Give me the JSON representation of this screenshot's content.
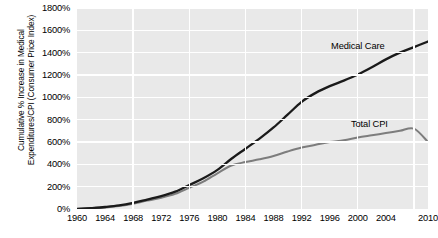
{
  "chart_data": {
    "type": "line",
    "title": "",
    "xlabel": "",
    "ylabel": "Cumulative % Increase in Medical Expenditures/CPI (Consumer Price Index)",
    "ylabel_lines": [
      "Cumulative % Increase in Medical",
      "Expenditures/CPI (Consumer Price Index)"
    ],
    "xlim": [
      1960,
      2010
    ],
    "ylim": [
      0,
      1800
    ],
    "grid": true,
    "legend_position": "inline-labels",
    "y_ticks": [
      0,
      200,
      400,
      600,
      800,
      1000,
      1200,
      1400,
      1600,
      1800
    ],
    "y_tick_labels": [
      "0%",
      "200%",
      "400%",
      "600%",
      "800%",
      "1000%",
      "1200%",
      "1400%",
      "1600%",
      "1800%"
    ],
    "x_ticks": [
      1960,
      1964,
      1968,
      1972,
      1976,
      1980,
      1984,
      1988,
      1992,
      1996,
      2000,
      2004,
      2010
    ],
    "x_tick_labels": [
      "1960",
      "1964",
      "1968",
      "1972",
      "1976",
      "1980",
      "1984",
      "1988",
      "1992",
      "1996",
      "2000",
      "2004",
      "2010"
    ],
    "x_gridlines": [
      1968,
      1976,
      1984,
      1992,
      2000,
      2008
    ],
    "series": [
      {
        "name": "Medical Care",
        "color": "#1a1a1a",
        "label_text": "Medical Care",
        "x": [
          1960,
          1962,
          1964,
          1966,
          1968,
          1970,
          1972,
          1974,
          1976,
          1978,
          1980,
          1982,
          1984,
          1986,
          1988,
          1990,
          1992,
          1994,
          1996,
          1998,
          2000,
          2002,
          2004,
          2006,
          2008,
          2010
        ],
        "values": [
          0,
          8,
          18,
          32,
          55,
          85,
          115,
          155,
          215,
          275,
          350,
          450,
          540,
          630,
          730,
          845,
          960,
          1040,
          1100,
          1150,
          1205,
          1270,
          1340,
          1400,
          1450,
          1500
        ]
      },
      {
        "name": "Total CPI",
        "color": "#7d7d7d",
        "label_text": "Total CPI",
        "x": [
          1960,
          1962,
          1964,
          1966,
          1968,
          1970,
          1972,
          1974,
          1976,
          1978,
          1980,
          1982,
          1984,
          1986,
          1988,
          1990,
          1992,
          1994,
          1996,
          1998,
          2000,
          2002,
          2004,
          2006,
          2008,
          2010
        ],
        "values": [
          0,
          6,
          14,
          26,
          46,
          75,
          100,
          135,
          190,
          245,
          320,
          390,
          420,
          445,
          475,
          515,
          550,
          575,
          600,
          615,
          640,
          660,
          680,
          700,
          720,
          600
        ]
      }
    ]
  }
}
